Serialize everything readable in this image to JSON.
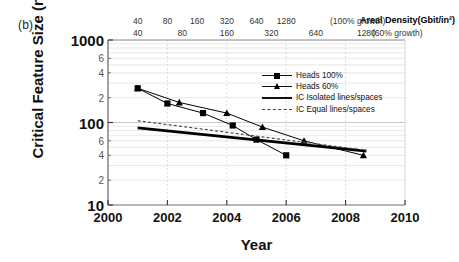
{
  "panel": {
    "label": "(b)"
  },
  "chart_data": {
    "type": "line",
    "title": "Areal Density(Gbit/in²)",
    "xlabel": "Year",
    "ylabel": "Critical Feature Size (nm)",
    "xlim": [
      2000,
      2010
    ],
    "ylim": [
      10,
      1000
    ],
    "yscale": "log",
    "xscale": "linear",
    "grid": true,
    "legend_position": "upper-right-inside",
    "x_ticks": [
      "2000",
      "2002",
      "2004",
      "2006",
      "2008",
      "2010"
    ],
    "x_tick_values": [
      2000,
      2002,
      2004,
      2006,
      2008,
      2010
    ],
    "y_ticks_major": [
      "10",
      "100",
      "1000"
    ],
    "y_tick_major_values": [
      10,
      100,
      1000
    ],
    "y_ticks_minor": [
      "2",
      "4",
      "6",
      "2",
      "4",
      "6"
    ],
    "y_tick_minor_values": [
      20,
      40,
      60,
      200,
      400,
      600
    ],
    "top_axis": {
      "label": "Areal Density(Gbit/in²)",
      "row1_note": "(100% growth)",
      "row2_note": "(60% growth)",
      "row1_ticks": [
        "40",
        "80",
        "160",
        "320",
        "640",
        "1280"
      ],
      "row1_tick_values": [
        40,
        80,
        160,
        320,
        640,
        1280
      ],
      "row1_tick_years": [
        2001,
        2002,
        2003,
        2004,
        2005,
        2006
      ],
      "row2_ticks": [
        "40",
        "80",
        "160",
        "320",
        "640",
        "1280"
      ],
      "row2_tick_values": [
        40,
        80,
        160,
        320,
        640,
        1280
      ],
      "row2_tick_years": [
        2001,
        2002.5,
        2004,
        2005.5,
        2007,
        2008.7
      ]
    },
    "series": [
      {
        "name": "Heads 100%",
        "marker": "square",
        "linestyle": "solid",
        "color": "#000000",
        "x": [
          2001.0,
          2002.0,
          2003.2,
          2004.2,
          2005.0,
          2006.0
        ],
        "y": [
          260,
          170,
          130,
          92,
          62,
          40
        ]
      },
      {
        "name": "Heads 60%",
        "marker": "triangle",
        "linestyle": "solid",
        "color": "#000000",
        "x": [
          2001.0,
          2002.4,
          2004.0,
          2005.2,
          2006.6,
          2008.6
        ],
        "y": [
          260,
          175,
          130,
          88,
          60,
          40
        ]
      },
      {
        "name": "IC Isolated lines/spaces",
        "marker": "none",
        "linestyle": "thick-solid",
        "color": "#000000",
        "x": [
          2001.0,
          2008.7
        ],
        "y": [
          86,
          45
        ]
      },
      {
        "name": "IC Equal lines/spaces",
        "marker": "none",
        "linestyle": "dashed",
        "color": "#444444",
        "x": [
          2001.0,
          2008.7
        ],
        "y": [
          105,
          46
        ]
      }
    ]
  }
}
